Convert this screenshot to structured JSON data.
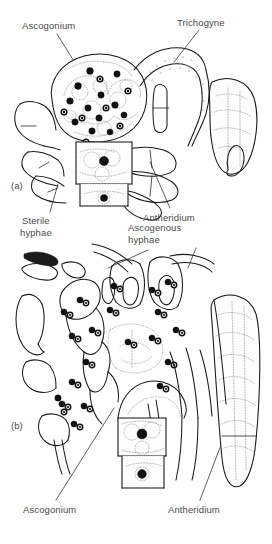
{
  "figure": {
    "background_color": "#ffffff",
    "ink_color": "#1a1a1a",
    "label_color": "#4a4a4a"
  },
  "panels": [
    {
      "tag": "(a)",
      "description": "Ascogonium with trichogyne contacting antheridium; multinucleate ascogonium cell",
      "labels": [
        "Ascogonium",
        "Trichogyne",
        "Sterile hyphae",
        "Antheridium"
      ]
    },
    {
      "tag": "(b)",
      "description": "Ascogenous hyphae growing from ascogonium with paired nuclei",
      "labels": [
        "Ascogenous hyphae",
        "Ascogonium",
        "Antheridium"
      ]
    }
  ],
  "labels": {
    "ascogonium_top": "Ascogonium",
    "trichogyne": "Trichogyne",
    "sterile_hyphae": "Sterile\nhyphae",
    "antheridium_top": "Antheridium",
    "ascogenous_hyphae": "Ascogenous\n  hyphae",
    "ascogonium_bottom": "Ascogonium",
    "antheridium_bottom": "Antheridium",
    "panel_a": "(a)",
    "panel_b": "(b)"
  },
  "structures": {
    "ascogonium": "large round multinucleate cell",
    "trichogyne": "elongate receptive hypha extending from ascogonium",
    "antheridium": "club-shaped male gametangium",
    "sterile_hyphae": "unbranched supporting hyphae",
    "ascogenous_hyphae": "branched dikaryotic hyphae bearing paired nuclei"
  },
  "nuclei": {
    "dark_count_panel_a": 24,
    "paired_count_panel_b": 22,
    "style_solid": "solid black nucleus",
    "style_ringed": "ringed nucleus with dark core"
  }
}
